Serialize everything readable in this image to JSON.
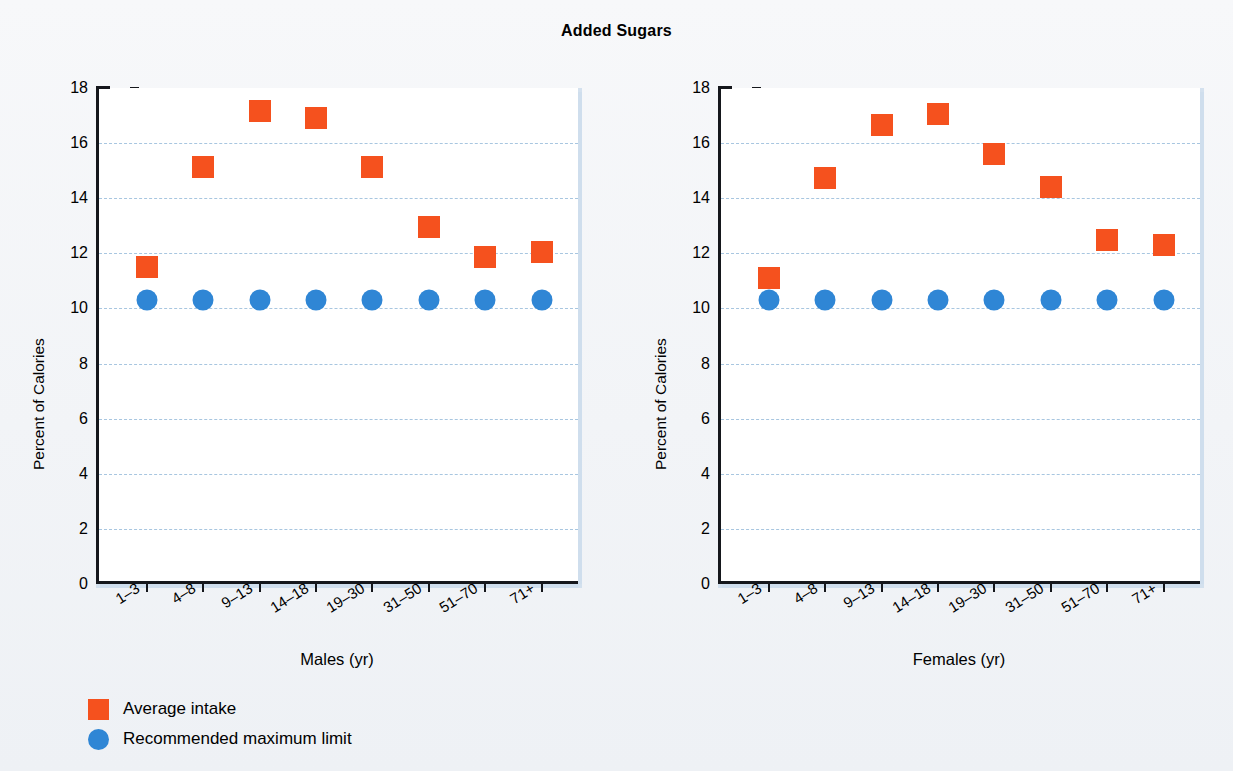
{
  "chart_data": {
    "type": "scatter",
    "title": "Added Sugars",
    "ylabel": "Percent of Calories",
    "ylim": [
      0,
      18
    ],
    "yticks": [
      0,
      2,
      4,
      6,
      8,
      10,
      12,
      14,
      16,
      18
    ],
    "grid": true,
    "legend_position": "bottom-left",
    "legend": [
      {
        "label": "Average intake",
        "marker": "square",
        "color": "#f5511e"
      },
      {
        "label": "Recommended maximum limit",
        "marker": "circle",
        "color": "#2f86d5"
      }
    ],
    "panels": [
      {
        "xlabel": "Males (yr)",
        "categories": [
          "1–3",
          "4–8",
          "9–13",
          "14–18",
          "19–30",
          "31–50",
          "51–70",
          "71+"
        ],
        "series": [
          {
            "name": "Average intake",
            "marker": "square",
            "color": "#f5511e",
            "values": [
              11.5,
              15.15,
              17.15,
              16.9,
              15.15,
              12.95,
              11.85,
              12.05
            ]
          },
          {
            "name": "Recommended maximum limit",
            "marker": "circle",
            "color": "#2f86d5",
            "values": [
              10.3,
              10.3,
              10.3,
              10.3,
              10.3,
              10.3,
              10.3,
              10.3
            ]
          }
        ]
      },
      {
        "xlabel": "Females (yr)",
        "categories": [
          "1–3",
          "4–8",
          "9–13",
          "14–18",
          "19–30",
          "31–50",
          "51–70",
          "71+"
        ],
        "series": [
          {
            "name": "Average intake",
            "marker": "square",
            "color": "#f5511e",
            "values": [
              11.1,
              14.75,
              16.65,
              17.05,
              15.6,
              14.4,
              12.5,
              12.3
            ]
          },
          {
            "name": "Recommended maximum limit",
            "marker": "circle",
            "color": "#2f86d5",
            "values": [
              10.3,
              10.3,
              10.3,
              10.3,
              10.3,
              10.3,
              10.3,
              10.3
            ]
          }
        ]
      }
    ]
  }
}
